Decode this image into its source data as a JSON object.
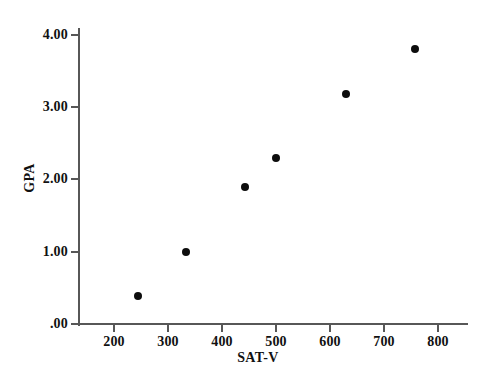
{
  "chart_data": {
    "type": "scatter",
    "title": "",
    "xlabel": "SAT-V",
    "ylabel": "GPA",
    "xlim": [
      150,
      865
    ],
    "ylim": [
      0.0,
      4.1
    ],
    "grid": false,
    "legend": null,
    "xticks": [
      200,
      300,
      400,
      500,
      600,
      700,
      800
    ],
    "xticklabels": [
      "200",
      "300",
      "400",
      "500",
      "600",
      "700",
      "800"
    ],
    "yticks": [
      0.0,
      1.0,
      2.0,
      3.0,
      4.0
    ],
    "yticklabels": [
      ".00",
      "1.00",
      "2.00",
      "3.00",
      "4.00"
    ],
    "marker": "filled-circle",
    "marker_color": "#0d0d0d",
    "axis_color": "#575757",
    "x": [
      244,
      333,
      443,
      500,
      630,
      757
    ],
    "y": [
      0.39,
      1.0,
      1.9,
      2.3,
      3.18,
      3.8
    ],
    "points": [
      {
        "label": "point-1",
        "x": 244,
        "y": 0.39
      },
      {
        "label": "point-2",
        "x": 333,
        "y": 1.0
      },
      {
        "label": "point-3",
        "x": 443,
        "y": 1.9
      },
      {
        "label": "point-4",
        "x": 500,
        "y": 2.3
      },
      {
        "label": "point-5",
        "x": 630,
        "y": 3.18
      },
      {
        "label": "point-6",
        "x": 757,
        "y": 3.8
      }
    ]
  }
}
